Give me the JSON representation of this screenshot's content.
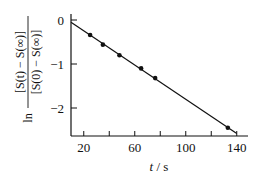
{
  "chart_data": {
    "type": "scatter",
    "title": "",
    "xlabel": "t / s",
    "ylabel": "ln [S(t) − S(∞)] / [S(0) − S(∞)]",
    "ylabel_parts": {
      "prefix": "ln",
      "numerator": "[S(t) − S(∞)]",
      "denominator": "[S(0) − S(∞)]"
    },
    "xlim": [
      10,
      150
    ],
    "ylim": [
      -2.6,
      0.1
    ],
    "xticks": [
      20,
      40,
      60,
      80,
      100,
      120,
      140
    ],
    "xtick_labels": [
      "20",
      "",
      "60",
      "",
      "100",
      "",
      "140"
    ],
    "yticks": [
      0,
      -1,
      -2
    ],
    "ytick_labels": [
      "0",
      "−1",
      "−2"
    ],
    "grid": false,
    "legend": null,
    "series": [
      {
        "name": "measured",
        "marker": "filled-circle",
        "x": [
          25,
          35,
          48,
          65,
          76,
          133
        ],
        "y": [
          -0.34,
          -0.56,
          -0.8,
          -1.1,
          -1.32,
          -2.45
        ]
      },
      {
        "name": "linear fit",
        "style": "line",
        "x": [
          10,
          140
        ],
        "y": [
          -0.05,
          -2.58
        ]
      }
    ]
  }
}
